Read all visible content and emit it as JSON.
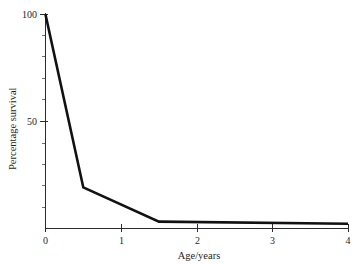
{
  "figure": {
    "background_color": "#ffffff",
    "line_color": "#111111",
    "axis_color": "#2b2b2b",
    "text_color": "#1f1f1f"
  },
  "chart_data": {
    "type": "line",
    "title": "",
    "xlabel": "Age/years",
    "ylabel": "Percentage survival",
    "xlim": [
      0,
      4
    ],
    "ylim": [
      0,
      100
    ],
    "grid": false,
    "legend": false,
    "x_ticks": [
      0,
      1,
      2,
      3,
      4
    ],
    "x_tick_labels": [
      "0",
      "1",
      "2",
      "3",
      "4"
    ],
    "x_minor_ticks": [
      0.5,
      1.5,
      2.5,
      3.5
    ],
    "y_ticks": [
      50,
      100
    ],
    "y_tick_labels": [
      "50",
      "100"
    ],
    "y_minor_ticks": [
      10,
      20,
      30,
      40,
      60,
      70,
      80,
      90
    ],
    "series": [
      {
        "name": "survival",
        "x": [
          0,
          0.5,
          1.5,
          4
        ],
        "values": [
          100,
          19,
          3,
          2
        ]
      }
    ]
  },
  "labels": {
    "x_axis_title": "Age/years",
    "y_axis_title": "Percentage survival",
    "x_tick_0": "0",
    "x_tick_1": "1",
    "x_tick_2": "2",
    "x_tick_3": "3",
    "x_tick_4": "4",
    "y_tick_50": "50",
    "y_tick_100": "100"
  }
}
